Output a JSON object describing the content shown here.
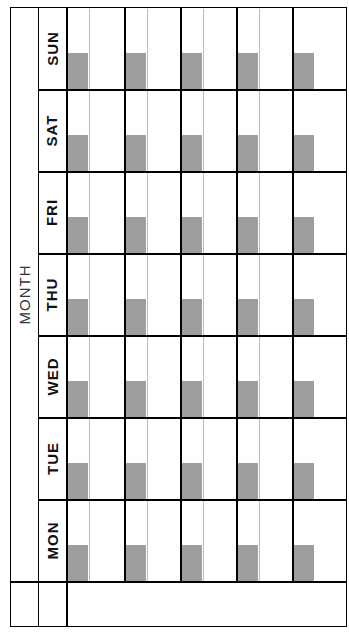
{
  "calendar": {
    "month_label": "MONTH",
    "days": [
      "SUN",
      "SAT",
      "FRI",
      "THU",
      "WED",
      "TUE",
      "MON"
    ],
    "weeks": 5,
    "colors": {
      "grid": "#000000",
      "divider": "#bdbdbd",
      "date_box": "#9e9e9e"
    }
  }
}
